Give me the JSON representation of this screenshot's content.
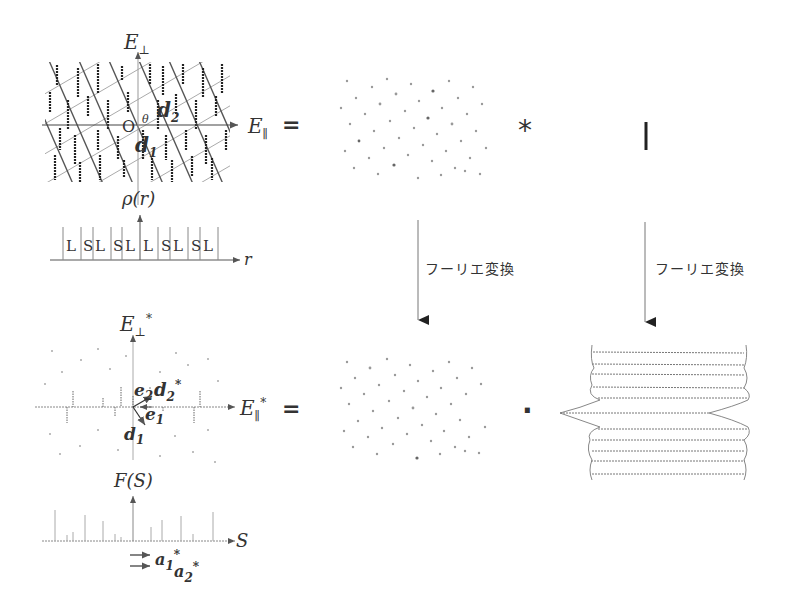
{
  "figure": {
    "top_left": {
      "axis_vertical": "E",
      "axis_vertical_sub": "⊥",
      "axis_horizontal": "E",
      "axis_horizontal_sub": "∥",
      "origin": "O",
      "angle": "θ",
      "vec_d1": "d",
      "vec_d1_sub": "1",
      "vec_d2": "d",
      "vec_d2_sub": "2",
      "density_label": "ρ(r)",
      "r_axis": "r",
      "sequence": [
        "L",
        "S",
        "L",
        "S",
        "L",
        "L",
        "S",
        "L",
        "S",
        "L"
      ]
    },
    "equals_top": "=",
    "convolve_symbol": "*",
    "arrows": [
      {
        "label": "フーリエ変換"
      },
      {
        "label": "フーリエ変換"
      }
    ],
    "bottom_left": {
      "axis_vertical": "E",
      "axis_vertical_sub": "⊥",
      "axis_vertical_sup": "*",
      "axis_horizontal": "E",
      "axis_horizontal_sub": "∥",
      "axis_horizontal_sup": "*",
      "vec_e1": "e",
      "vec_e1_sub": "1",
      "vec_e2": "e",
      "vec_e2_sub": "2",
      "vec_d1": "d",
      "vec_d1_sub": "1",
      "vec_d2star": "d",
      "vec_d2star_sub": "2",
      "vec_d2star_sup": "*",
      "structure_factor_label": "F(S)",
      "s_axis": "S",
      "vec_a1star": "a",
      "vec_a1star_sub": "1",
      "vec_a1star_sup": "*",
      "vec_a2star": "a",
      "vec_a2star_sub": "2",
      "vec_a2star_sup": "*"
    },
    "equals_bottom": "=",
    "product_symbol": "·"
  }
}
